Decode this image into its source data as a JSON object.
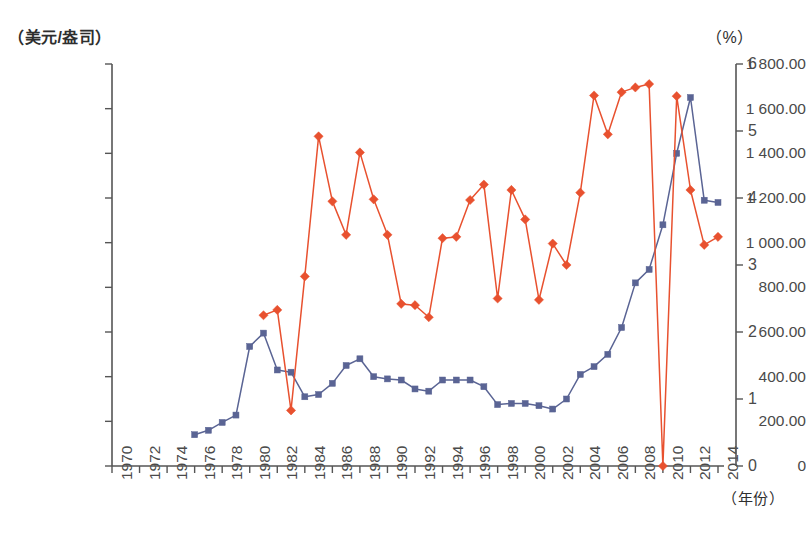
{
  "axes": {
    "left_unit": "（美元/盎司）",
    "right_unit": "（%）",
    "x_unit": "（年份）",
    "left_ticks": [
      "0",
      "200.00",
      "400.00",
      "600.00",
      "800.00",
      "1 000.00",
      "1 200.00",
      "1 400.00",
      "1 600.00",
      "1 800.00"
    ],
    "right_ticks": [
      "0",
      "1",
      "2",
      "3",
      "4",
      "5",
      "6"
    ],
    "x_ticks": [
      "1970",
      "1972",
      "1974",
      "1976",
      "1978",
      "1980",
      "1982",
      "1984",
      "1986",
      "1988",
      "1990",
      "1992",
      "1994",
      "1996",
      "1998",
      "2000",
      "2002",
      "2004",
      "2006",
      "2008",
      "2010",
      "2012",
      "2014"
    ]
  },
  "colors": {
    "gold_price_series": "#5a6494",
    "percent_series": "#e8512f",
    "axis": "#555555",
    "text": "#3a3a3a"
  },
  "chart_data": {
    "type": "line",
    "title": "",
    "subtitle": "",
    "xlabel": "（年份）",
    "ylabel": "（美元/盎司）",
    "y2label": "（%）",
    "xlim": [
      1970,
      2014
    ],
    "ylim": [
      0,
      1800
    ],
    "y2lim": [
      0,
      6
    ],
    "grid": false,
    "legend_position": "none",
    "x": [
      1970,
      1971,
      1972,
      1973,
      1974,
      1975,
      1976,
      1977,
      1978,
      1979,
      1980,
      1981,
      1982,
      1983,
      1984,
      1985,
      1986,
      1987,
      1988,
      1989,
      1990,
      1991,
      1992,
      1993,
      1994,
      1995,
      1996,
      1997,
      1998,
      1999,
      2000,
      2001,
      2002,
      2003,
      2004,
      2005,
      2006,
      2007,
      2008,
      2009,
      2010,
      2011,
      2012,
      2013,
      2014
    ],
    "series": [
      {
        "name": "黄金价格",
        "axis": "left",
        "marker": "square",
        "color": "#5a6494",
        "unit": "美元/盎司",
        "values": [
          null,
          null,
          null,
          null,
          null,
          null,
          140,
          160,
          195,
          228,
          535,
          595,
          430,
          420,
          310,
          320,
          370,
          450,
          480,
          400,
          390,
          385,
          345,
          335,
          385,
          385,
          385,
          355,
          275,
          280,
          280,
          270,
          255,
          300,
          410,
          445,
          500,
          620,
          820,
          880,
          1080,
          1400,
          1650,
          1190,
          1180
        ]
      },
      {
        "name": "占比",
        "axis": "right",
        "marker": "diamond",
        "color": "#e8512f",
        "unit": "%",
        "values": [
          null,
          null,
          null,
          null,
          null,
          null,
          null,
          null,
          null,
          null,
          null,
          2.25,
          2.33,
          0.83,
          2.83,
          4.92,
          3.95,
          3.45,
          4.68,
          3.98,
          3.45,
          2.42,
          2.4,
          2.22,
          3.4,
          3.42,
          3.97,
          4.2,
          2.5,
          4.12,
          3.68,
          2.48,
          3.32,
          3.0,
          4.08,
          5.53,
          4.95,
          5.58,
          5.65,
          5.7,
          0.0,
          5.52,
          4.12,
          3.3,
          3.42
        ]
      }
    ]
  }
}
